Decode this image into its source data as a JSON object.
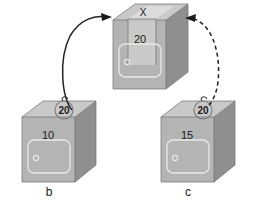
{
  "figure": {
    "background_color": "#ffffff",
    "box_front_color": "#b4b4b4",
    "box_top_color": "#c9c9c9",
    "box_side_color": "#8f8f8f",
    "arrow_color": "#1a1a1a"
  },
  "boxes": [
    {
      "id": "top",
      "name": "result-box",
      "top_label": "X",
      "front_value": "20",
      "caption": "",
      "has_overlay_panel": true,
      "has_badge": false
    },
    {
      "id": "left",
      "name": "source-box-b",
      "top_label": "",
      "front_value": "10",
      "badge_value": "20",
      "caption": "b",
      "has_overlay_panel": false,
      "has_badge": true
    },
    {
      "id": "right",
      "name": "source-box-c",
      "top_label": "",
      "front_value": "15",
      "badge_value": "20",
      "caption": "c",
      "has_overlay_panel": false,
      "has_badge": true
    }
  ],
  "arrows": [
    {
      "id": "arrow-left-to-top",
      "style": "solid",
      "from": "b",
      "to": "X"
    },
    {
      "id": "arrow-right-to-top",
      "style": "dashed",
      "from": "c",
      "to": "X"
    }
  ]
}
